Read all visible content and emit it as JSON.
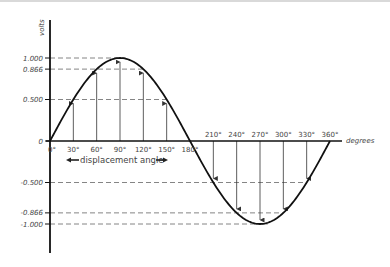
{
  "diagram": {
    "y_axis": {
      "label": "volts",
      "ticks": [
        {
          "value": 1.0,
          "label": "1.000"
        },
        {
          "value": 0.866,
          "label": "0.866"
        },
        {
          "value": 0.5,
          "label": "0.500"
        },
        {
          "value": 0,
          "label": "0"
        },
        {
          "value": -0.5,
          "label": "-0.500"
        },
        {
          "value": -0.866,
          "label": "-0.866"
        },
        {
          "value": -1.0,
          "label": "-1.000"
        }
      ]
    },
    "x_axis": {
      "label": "degrees",
      "ticks": [
        {
          "deg": 0,
          "label": "0°"
        },
        {
          "deg": 30,
          "label": "30°"
        },
        {
          "deg": 60,
          "label": "60°"
        },
        {
          "deg": 90,
          "label": "90°"
        },
        {
          "deg": 120,
          "label": "120°"
        },
        {
          "deg": 150,
          "label": "150°"
        },
        {
          "deg": 180,
          "label": "180°"
        },
        {
          "deg": 210,
          "label": "210°"
        },
        {
          "deg": 240,
          "label": "240°"
        },
        {
          "deg": 270,
          "label": "270°"
        },
        {
          "deg": 300,
          "label": "300°"
        },
        {
          "deg": 330,
          "label": "330°"
        },
        {
          "deg": 360,
          "label": "360°"
        }
      ]
    },
    "annotation": "displacement angle",
    "colors": {
      "curve": "#111111",
      "axis": "#111111",
      "dash": "#777777",
      "arrow": "#333333",
      "text": "#444444"
    }
  },
  "chart_data": {
    "type": "line",
    "title": "",
    "xlabel": "degrees",
    "ylabel": "volts",
    "x": [
      0,
      30,
      60,
      90,
      120,
      150,
      180,
      210,
      240,
      270,
      300,
      330,
      360
    ],
    "series": [
      {
        "name": "sin(θ)",
        "values": [
          0,
          0.5,
          0.866,
          1.0,
          0.866,
          0.5,
          0,
          -0.5,
          -0.866,
          -1.0,
          -0.866,
          -0.5,
          0
        ]
      }
    ],
    "xlim": [
      0,
      360
    ],
    "ylim": [
      -1.0,
      1.0
    ],
    "grid": false,
    "annotations": [
      "displacement angle"
    ]
  }
}
